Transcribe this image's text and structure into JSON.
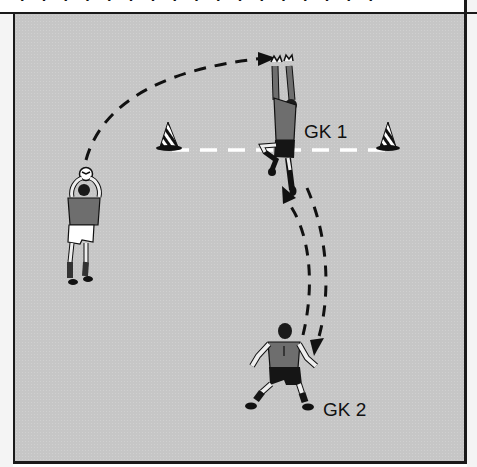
{
  "diagram": {
    "top_caption_fragment": "· ·  · · ·  ·  · ·  ·  · ·  · · ·  · ·  ·",
    "labels": {
      "gk1": "GK 1",
      "gk2": "GK 2"
    },
    "elements": {
      "cones": [
        "left-cone",
        "right-cone"
      ],
      "goal_line": "white dashed line between cones",
      "players": [
        "thrower",
        "goalkeeper-1",
        "goalkeeper-2"
      ],
      "paths": [
        "throw-arc-to-gk1",
        "gk1-to-gk2-pass",
        "gk2-to-gk1-return"
      ]
    },
    "colors": {
      "field": "#c6c6c6",
      "line": "#1a1a1a",
      "goal_line": "#ffffff",
      "jersey": "#6e6e6e",
      "shorts_dark": "#151515"
    }
  }
}
